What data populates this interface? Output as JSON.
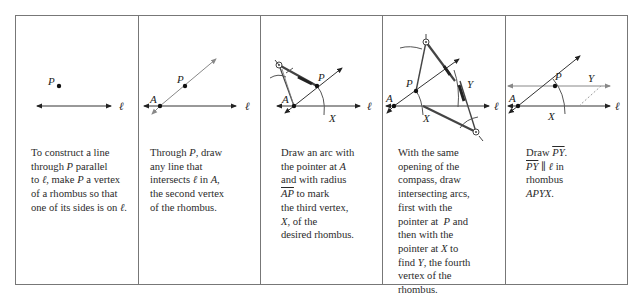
{
  "steps": [
    {
      "id": 1,
      "labels": {
        "point_p": "P",
        "line": "ℓ"
      },
      "caption": [
        "To construct a line",
        "through P parallel",
        "to ℓ, make P a vertex",
        "of a rhombus so that",
        "one of its sides is on ℓ."
      ]
    },
    {
      "id": 2,
      "labels": {
        "point_p": "P",
        "point_a": "A",
        "line": "ℓ"
      },
      "caption": [
        "Through P, draw",
        "any line that",
        "intersects ℓ in A,",
        "the second vertex",
        "of the rhombus."
      ]
    },
    {
      "id": 3,
      "labels": {
        "point_p": "P",
        "point_a": "A",
        "point_x": "X",
        "line": "ℓ"
      },
      "caption": [
        "Draw an arc with",
        "the pointer at A",
        "and with radius",
        "AP to mark",
        "the third vertex,",
        "X, of the",
        "desired rhombus."
      ]
    },
    {
      "id": 4,
      "labels": {
        "point_p": "P",
        "point_a": "A",
        "point_x": "X",
        "point_y": "Y",
        "line": "ℓ"
      },
      "caption": [
        "With the same",
        "opening of the",
        "compass, draw",
        "intersecting arcs,",
        "first with the",
        "pointer at  P and",
        "then with the",
        "pointer at X to",
        "find Y, the fourth",
        "vertex of the",
        "rhombus."
      ]
    },
    {
      "id": 5,
      "labels": {
        "point_p": "P",
        "point_a": "A",
        "point_x": "X",
        "point_y": "Y",
        "line": "ℓ"
      },
      "caption": [
        "Draw PY.",
        "PY ∥ ℓ in",
        "rhombus",
        "APYX."
      ]
    }
  ],
  "colors": {
    "border": "#777777",
    "line": "#333333",
    "construction": "#888888"
  }
}
